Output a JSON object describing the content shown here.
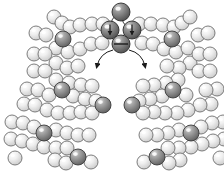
{
  "figure": {
    "title": "",
    "caption": "",
    "background_color": "#ffffff",
    "width": 224,
    "height": 175
  },
  "palette": {
    "light_sphere_fill": "#e8e8e8",
    "light_sphere_highlight": "#fdfdfd",
    "light_sphere_edge": "#6f6f6f",
    "dark_sphere_fill": "#8f8f8f",
    "dark_sphere_highlight": "#d9d9d9",
    "dark_sphere_edge": "#3a3a3a",
    "core_sphere_fill": "#7a7a7a",
    "core_sphere_highlight": "#c8c8c8",
    "core_sphere_edge": "#2b2b2b",
    "arrow_color": "#1a1a1a",
    "arc_color": "#1a1a1a"
  },
  "chart_data": {
    "type": "scatter",
    "title": "",
    "xlabel": "",
    "ylabel": "",
    "xlim": [
      0,
      224
    ],
    "ylim": [
      0,
      175
    ],
    "grid": false,
    "legend": "none",
    "series": [
      {
        "name": "core-cluster",
        "marker": "sphere-dark-shaded",
        "radius": 9,
        "points": [
          {
            "x": 121,
            "y": 12,
            "glyph": "none",
            "label": "core-top"
          },
          {
            "x": 110,
            "y": 30,
            "glyph": "arrow-down",
            "label": "core-left"
          },
          {
            "x": 132,
            "y": 30,
            "glyph": "arrow-down",
            "label": "core-right"
          },
          {
            "x": 121,
            "y": 44,
            "glyph": "horizontal-bar",
            "label": "core-bottom"
          }
        ]
      },
      {
        "name": "highlighted-atoms",
        "marker": "sphere-dark",
        "radius": 8,
        "points": [
          {
            "x": 63,
            "y": 39
          },
          {
            "x": 172,
            "y": 39
          },
          {
            "x": 62,
            "y": 90
          },
          {
            "x": 173,
            "y": 90
          },
          {
            "x": 103,
            "y": 105
          },
          {
            "x": 132,
            "y": 105
          },
          {
            "x": 44,
            "y": 133
          },
          {
            "x": 191,
            "y": 133
          },
          {
            "x": 78,
            "y": 157
          },
          {
            "x": 157,
            "y": 157
          }
        ]
      },
      {
        "name": "lattice-atoms",
        "marker": "sphere-light",
        "radius": 7,
        "points": [
          {
            "x": 54,
            "y": 17
          },
          {
            "x": 62,
            "y": 23
          },
          {
            "x": 70,
            "y": 27
          },
          {
            "x": 80,
            "y": 25
          },
          {
            "x": 92,
            "y": 24
          },
          {
            "x": 103,
            "y": 24
          },
          {
            "x": 139,
            "y": 24
          },
          {
            "x": 151,
            "y": 24
          },
          {
            "x": 163,
            "y": 25
          },
          {
            "x": 174,
            "y": 27
          },
          {
            "x": 182,
            "y": 23
          },
          {
            "x": 190,
            "y": 17
          },
          {
            "x": 36,
            "y": 33
          },
          {
            "x": 46,
            "y": 35
          },
          {
            "x": 56,
            "y": 48
          },
          {
            "x": 68,
            "y": 52
          },
          {
            "x": 80,
            "y": 49
          },
          {
            "x": 91,
            "y": 44
          },
          {
            "x": 102,
            "y": 43
          },
          {
            "x": 142,
            "y": 43
          },
          {
            "x": 153,
            "y": 44
          },
          {
            "x": 164,
            "y": 49
          },
          {
            "x": 176,
            "y": 52
          },
          {
            "x": 188,
            "y": 48
          },
          {
            "x": 198,
            "y": 35
          },
          {
            "x": 208,
            "y": 33
          },
          {
            "x": 34,
            "y": 54
          },
          {
            "x": 45,
            "y": 54
          },
          {
            "x": 56,
            "y": 63
          },
          {
            "x": 67,
            "y": 68
          },
          {
            "x": 78,
            "y": 66
          },
          {
            "x": 190,
            "y": 63
          },
          {
            "x": 179,
            "y": 68
          },
          {
            "x": 167,
            "y": 66
          },
          {
            "x": 199,
            "y": 54
          },
          {
            "x": 210,
            "y": 54
          },
          {
            "x": 34,
            "y": 71
          },
          {
            "x": 45,
            "y": 71
          },
          {
            "x": 56,
            "y": 80
          },
          {
            "x": 69,
            "y": 83
          },
          {
            "x": 81,
            "y": 85
          },
          {
            "x": 92,
            "y": 86
          },
          {
            "x": 199,
            "y": 71
          },
          {
            "x": 210,
            "y": 71
          },
          {
            "x": 178,
            "y": 80
          },
          {
            "x": 166,
            "y": 83
          },
          {
            "x": 154,
            "y": 85
          },
          {
            "x": 143,
            "y": 86
          },
          {
            "x": 27,
            "y": 89
          },
          {
            "x": 38,
            "y": 90
          },
          {
            "x": 49,
            "y": 95
          },
          {
            "x": 73,
            "y": 96
          },
          {
            "x": 85,
            "y": 99
          },
          {
            "x": 96,
            "y": 101
          },
          {
            "x": 217,
            "y": 89
          },
          {
            "x": 206,
            "y": 90
          },
          {
            "x": 186,
            "y": 95
          },
          {
            "x": 162,
            "y": 96
          },
          {
            "x": 150,
            "y": 99
          },
          {
            "x": 139,
            "y": 101
          },
          {
            "x": 24,
            "y": 104
          },
          {
            "x": 35,
            "y": 105
          },
          {
            "x": 47,
            "y": 110
          },
          {
            "x": 58,
            "y": 113
          },
          {
            "x": 70,
            "y": 113
          },
          {
            "x": 81,
            "y": 112
          },
          {
            "x": 92,
            "y": 113
          },
          {
            "x": 211,
            "y": 104
          },
          {
            "x": 200,
            "y": 105
          },
          {
            "x": 188,
            "y": 110
          },
          {
            "x": 177,
            "y": 113
          },
          {
            "x": 165,
            "y": 113
          },
          {
            "x": 154,
            "y": 112
          },
          {
            "x": 143,
            "y": 113
          },
          {
            "x": 12,
            "y": 122
          },
          {
            "x": 23,
            "y": 123
          },
          {
            "x": 34,
            "y": 127
          },
          {
            "x": 56,
            "y": 130
          },
          {
            "x": 67,
            "y": 133
          },
          {
            "x": 78,
            "y": 135
          },
          {
            "x": 89,
            "y": 135
          },
          {
            "x": 223,
            "y": 122
          },
          {
            "x": 212,
            "y": 123
          },
          {
            "x": 201,
            "y": 127
          },
          {
            "x": 179,
            "y": 130
          },
          {
            "x": 168,
            "y": 133
          },
          {
            "x": 157,
            "y": 135
          },
          {
            "x": 146,
            "y": 135
          },
          {
            "x": 11,
            "y": 139
          },
          {
            "x": 22,
            "y": 141
          },
          {
            "x": 33,
            "y": 144
          },
          {
            "x": 44,
            "y": 147
          },
          {
            "x": 56,
            "y": 148
          },
          {
            "x": 67,
            "y": 148
          },
          {
            "x": 224,
            "y": 139
          },
          {
            "x": 213,
            "y": 141
          },
          {
            "x": 202,
            "y": 144
          },
          {
            "x": 191,
            "y": 147
          },
          {
            "x": 179,
            "y": 148
          },
          {
            "x": 168,
            "y": 148
          },
          {
            "x": 55,
            "y": 160
          },
          {
            "x": 66,
            "y": 163
          },
          {
            "x": 180,
            "y": 160
          },
          {
            "x": 169,
            "y": 163
          },
          {
            "x": 91,
            "y": 162
          },
          {
            "x": 144,
            "y": 162
          },
          {
            "x": 15,
            "y": 158
          },
          {
            "x": 220,
            "y": 158
          }
        ]
      }
    ],
    "annotations": [
      {
        "type": "arc",
        "name": "bond-arc-top-left",
        "from": [
          121,
          12
        ],
        "to": [
          110,
          30
        ]
      },
      {
        "type": "arc",
        "name": "bond-arc-top-right",
        "from": [
          121,
          12
        ],
        "to": [
          132,
          30
        ]
      },
      {
        "type": "arc",
        "name": "bond-arc-bottom-left",
        "from": [
          110,
          30
        ],
        "to": [
          121,
          44
        ]
      },
      {
        "type": "arc",
        "name": "bond-arc-bottom-right",
        "from": [
          132,
          30
        ],
        "to": [
          121,
          44
        ]
      },
      {
        "type": "curved-arrow",
        "name": "motion-arrow-left",
        "from": [
          113,
          50
        ],
        "to": [
          97,
          66
        ],
        "direction": "down-left"
      },
      {
        "type": "curved-arrow",
        "name": "motion-arrow-right",
        "from": [
          129,
          50
        ],
        "to": [
          145,
          66
        ],
        "direction": "down-right"
      },
      {
        "type": "glyph-arrow",
        "name": "spin-arrow-left",
        "at": [
          110,
          30
        ],
        "direction": "down"
      },
      {
        "type": "glyph-arrow",
        "name": "spin-arrow-right",
        "at": [
          132,
          30
        ],
        "direction": "down"
      },
      {
        "type": "glyph-bar",
        "name": "node-bar-bottom",
        "at": [
          121,
          44
        ],
        "direction": "horizontal"
      }
    ]
  }
}
